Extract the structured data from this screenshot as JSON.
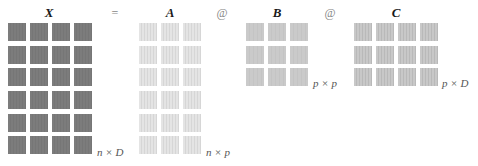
{
  "equation": {
    "lhs": {
      "label": "X",
      "rows": 6,
      "cols": 4,
      "dims": "n × D",
      "color": "#7a7a7a"
    },
    "equals": "=",
    "factors": [
      {
        "label": "A",
        "rows": 6,
        "cols": 3,
        "dims": "n × p",
        "color": "#e2e2e2"
      },
      {
        "label": "B",
        "rows": 3,
        "cols": 3,
        "dims": "p × p",
        "color": "#c8c8c8"
      },
      {
        "label": "C",
        "rows": 3,
        "cols": 4,
        "dims": "p × D",
        "color": "#c2c2c2"
      }
    ],
    "operators": [
      "@",
      "@"
    ]
  }
}
